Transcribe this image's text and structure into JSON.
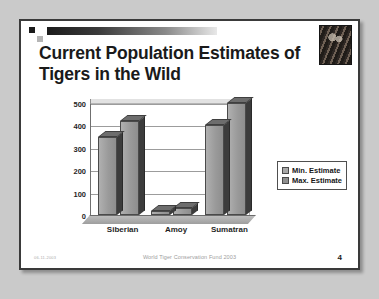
{
  "slide": {
    "title": "Current Population Estimates of Tigers in the Wild",
    "photo_alt": "tiger-photograph",
    "footer_date": "06-11-2003",
    "footer_center": "World Tiger Conservation Fund 2003",
    "slide_number": "4"
  },
  "colors": {
    "background": "#cacaca",
    "slide_bg": "#ffffff",
    "slide_border": "#3a3a3a",
    "title_text": "#1a1a1a",
    "bar_front": "#9a9a9a",
    "bar_side": "#3c3c3c",
    "bar_top": "#6d6d6d",
    "gridline": "#9c9c9c"
  },
  "chart_data": {
    "type": "bar",
    "title": "",
    "xlabel": "",
    "ylabel": "",
    "categories": [
      "Siberian",
      "Amoy",
      "Sumatran"
    ],
    "series": [
      {
        "name": "Min. Estimate",
        "values": [
          350,
          20,
          400
        ]
      },
      {
        "name": "Max. Estimate",
        "values": [
          420,
          30,
          500
        ]
      }
    ],
    "ylim": [
      0,
      500
    ],
    "yticks": [
      0,
      100,
      200,
      300,
      400,
      500
    ],
    "ytick_labels": [
      "0",
      "100",
      "200",
      "300",
      "400",
      "500"
    ],
    "grid": true,
    "legend_position": "right",
    "three_d": true
  }
}
